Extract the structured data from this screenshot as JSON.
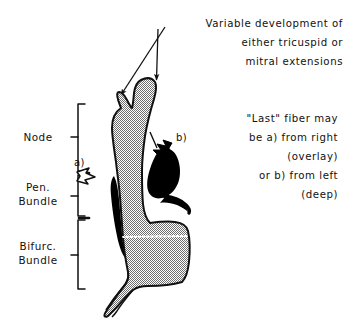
{
  "figure": {
    "background_color": "#ffffff",
    "ink_color": "#111111",
    "tissue_fill_color": "#b8b8b8",
    "solid_fiber_color": "#000000"
  },
  "annotations": {
    "top_note": {
      "name": "variable-development-note",
      "lines": [
        "Variable development of",
        "either tricuspid or",
        "mitral extensions"
      ],
      "pointer_count": 2,
      "pointer_targets": [
        "left tricuspid extension prong",
        "right mitral extension prong"
      ]
    },
    "right_note": {
      "name": "last-fiber-note",
      "lines": [
        "\"Last\" fiber may",
        "be a) from right",
        "(overlay)",
        "or b) from left",
        "(deep)"
      ]
    }
  },
  "markers": [
    {
      "id": "a",
      "label": "a)",
      "style": "hollow-outlined-arrow",
      "description": "last fiber from right, overlay",
      "points_to": "left margin of penetrating bundle"
    },
    {
      "id": "b",
      "label": "b)",
      "style": "solid-black-arrow",
      "description": "last fiber from left, deep",
      "points_to": "black deep fiber mass on right of node"
    }
  ],
  "brackets": [
    {
      "name": "node",
      "label_lines": [
        "Node"
      ],
      "span_top_px": 104,
      "span_bottom_px": 173
    },
    {
      "name": "penetrating-bundle",
      "label_lines": [
        "Pen.",
        "Bundle"
      ],
      "span_top_px": 173,
      "span_bottom_px": 218
    },
    {
      "name": "bifurcating-bundle",
      "label_lines": [
        "Bifurc.",
        "Bundle"
      ],
      "span_top_px": 218,
      "span_bottom_px": 290
    }
  ],
  "structures": [
    {
      "name": "conduction-axis-body",
      "fill": "stipple",
      "description": "Y-notched node above, tapering penetrating bundle, widened bifurcating bundle with tail"
    },
    {
      "name": "deep-fiber-mass",
      "fill": "solid-black",
      "description": "teardrop black mass right of node with hook curving down and right"
    },
    {
      "name": "overlay-fiber-sliver",
      "fill": "solid-black",
      "description": "crescent black sliver along left margin of penetrating bundle"
    },
    {
      "name": "bundle-branch-divider",
      "fill": "white-dotted-line",
      "description": "dotted line across bifurcating bundle"
    }
  ]
}
